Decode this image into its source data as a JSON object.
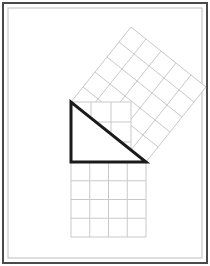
{
  "figure": {
    "type": "pythagorean-theorem-diagram",
    "canvas": {
      "width": 210,
      "height": 266
    },
    "background_color": "#ffffff",
    "frame": {
      "outer_border_color": "#4a4a4a",
      "outer_border_width": 2,
      "outer_rect": {
        "x": 3,
        "y": 3,
        "width": 204,
        "height": 260
      },
      "inner_border_color": "#bdbdbd",
      "inner_border_width": 1,
      "inner_rect": {
        "x": 8,
        "y": 8,
        "width": 194,
        "height": 250
      }
    },
    "triangle": {
      "name": "right-triangle",
      "stroke_color": "#1a1a1a",
      "stroke_width": 3,
      "fill": "#ffffff",
      "vertices": [
        {
          "label": "top-left-right-angle",
          "x": 71,
          "y": 102
        },
        {
          "label": "bottom-left",
          "x": 71,
          "y": 162
        },
        {
          "label": "bottom-right",
          "x": 146,
          "y": 162
        }
      ],
      "leg_vertical_units": 3,
      "leg_horizontal_units": 4,
      "hypotenuse_units": 5
    },
    "squares": [
      {
        "name": "square-on-vertical-leg",
        "side_units": 3,
        "area_units": 9,
        "divisions": 3,
        "grid_color": "#c9c9c9",
        "grid_width": 1,
        "fill": "#ffffff",
        "origin": {
          "x": 71,
          "y": 102
        },
        "side_length_px": 60,
        "rotation_deg": 180
      },
      {
        "name": "square-on-horizontal-leg",
        "side_units": 4,
        "area_units": 16,
        "divisions": 4,
        "grid_color": "#c9c9c9",
        "grid_width": 1,
        "fill": "#ffffff",
        "origin": {
          "x": 71,
          "y": 162
        },
        "side_length_px": 75,
        "rotation_deg": 0
      },
      {
        "name": "square-on-hypotenuse",
        "side_units": 5,
        "area_units": 25,
        "divisions": 5,
        "grid_color": "#c9c9c9",
        "grid_width": 1,
        "fill": "#ffffff",
        "origin": {
          "x": 71,
          "y": 102
        },
        "side_length_px": 96,
        "rotation_deg": -38.66,
        "corners": [
          {
            "x": 71,
            "y": 102
          },
          {
            "x": 146,
            "y": 162
          },
          {
            "x": 201,
            "y": 82
          },
          {
            "x": 127,
            "y": 22
          }
        ]
      }
    ]
  }
}
